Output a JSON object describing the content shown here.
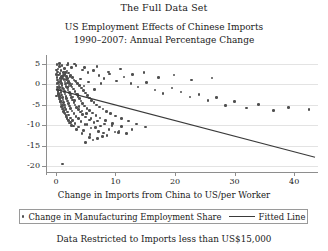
{
  "figure": {
    "caption_top": "The Full Data Set",
    "caption_bottom": "Data Restricted to Imports less than US$15,000"
  },
  "chart_data": {
    "type": "scatter",
    "title": "US Employment Effects of Chinese Imports",
    "subtitle": "1990–2007: Annual Percentage Change",
    "xlabel": "Change in Imports from China to US/per Worker",
    "ylabel": "",
    "xlim": [
      -1.5,
      44
    ],
    "ylim": [
      -21.5,
      6.5
    ],
    "xticks": [
      0,
      10,
      20,
      30,
      40
    ],
    "yticks": [
      5,
      0,
      -5,
      -10,
      -15,
      -20
    ],
    "xticklabels": [
      "0",
      "10",
      "20",
      "30",
      "40"
    ],
    "yticklabels": [
      "5",
      "0",
      "-5",
      "-10",
      "-15",
      "-20"
    ],
    "grid": "horizontal",
    "legend_position": "below-axes",
    "series": [
      {
        "name": "Change in Manufacturing Employment Share",
        "marker": "dot",
        "color": "#4f4f4f",
        "points": [
          [
            0.15,
            4.9
          ],
          [
            0.55,
            4.4
          ],
          [
            1.05,
            4.6
          ],
          [
            0.35,
            3.8
          ],
          [
            0.85,
            3.4
          ],
          [
            1.45,
            3.9
          ],
          [
            0.25,
            3.1
          ],
          [
            0.65,
            2.7
          ],
          [
            1.25,
            2.9
          ],
          [
            1.85,
            3.3
          ],
          [
            0.45,
            2.3
          ],
          [
            0.95,
            2.0
          ],
          [
            1.55,
            2.4
          ],
          [
            2.15,
            2.8
          ],
          [
            0.2,
            1.7
          ],
          [
            0.7,
            1.4
          ],
          [
            1.15,
            1.6
          ],
          [
            1.75,
            1.9
          ],
          [
            2.45,
            2.2
          ],
          [
            0.3,
            1.1
          ],
          [
            0.8,
            0.9
          ],
          [
            1.35,
            1.2
          ],
          [
            1.95,
            1.4
          ],
          [
            2.75,
            1.7
          ],
          [
            0.4,
            0.5
          ],
          [
            0.9,
            0.3
          ],
          [
            1.5,
            0.6
          ],
          [
            2.1,
            0.8
          ],
          [
            3.05,
            1.1
          ],
          [
            0.5,
            -0.1
          ],
          [
            1.0,
            -0.3
          ],
          [
            1.6,
            0.1
          ],
          [
            2.3,
            0.3
          ],
          [
            3.35,
            0.6
          ],
          [
            0.6,
            -0.7
          ],
          [
            1.1,
            -0.9
          ],
          [
            1.7,
            -0.5
          ],
          [
            2.5,
            -0.2
          ],
          [
            3.65,
            0.2
          ],
          [
            0.22,
            -1.2
          ],
          [
            0.75,
            -1.4
          ],
          [
            1.25,
            -1.1
          ],
          [
            1.9,
            -0.8
          ],
          [
            2.7,
            -0.6
          ],
          [
            4.0,
            -0.3
          ],
          [
            0.32,
            -1.8
          ],
          [
            0.88,
            -2.0
          ],
          [
            1.4,
            -1.7
          ],
          [
            2.05,
            -1.4
          ],
          [
            2.95,
            -1.1
          ],
          [
            4.3,
            -0.9
          ],
          [
            0.42,
            -2.4
          ],
          [
            0.98,
            -2.6
          ],
          [
            1.55,
            -2.3
          ],
          [
            2.25,
            -2.0
          ],
          [
            3.2,
            -1.7
          ],
          [
            4.6,
            -1.5
          ],
          [
            0.52,
            -3.0
          ],
          [
            1.08,
            -3.2
          ],
          [
            1.7,
            -2.9
          ],
          [
            2.4,
            -2.6
          ],
          [
            3.45,
            -2.3
          ],
          [
            4.95,
            -2.1
          ],
          [
            0.62,
            -3.6
          ],
          [
            1.18,
            -3.8
          ],
          [
            1.82,
            -3.5
          ],
          [
            2.6,
            -3.2
          ],
          [
            3.7,
            -2.9
          ],
          [
            5.3,
            -2.7
          ],
          [
            0.72,
            -4.2
          ],
          [
            1.3,
            -4.4
          ],
          [
            1.95,
            -4.1
          ],
          [
            2.8,
            -3.8
          ],
          [
            3.95,
            -3.5
          ],
          [
            5.65,
            -3.3
          ],
          [
            0.82,
            -4.8
          ],
          [
            1.42,
            -5.0
          ],
          [
            2.1,
            -4.7
          ],
          [
            3.0,
            -4.4
          ],
          [
            4.2,
            -4.1
          ],
          [
            6.0,
            -3.9
          ],
          [
            0.95,
            -5.4
          ],
          [
            1.55,
            -5.6
          ],
          [
            2.25,
            -5.3
          ],
          [
            3.2,
            -5.0
          ],
          [
            4.5,
            -4.7
          ],
          [
            6.4,
            -4.4
          ],
          [
            1.1,
            -6.0
          ],
          [
            1.7,
            -6.2
          ],
          [
            2.45,
            -5.9
          ],
          [
            3.45,
            -5.6
          ],
          [
            4.8,
            -5.3
          ],
          [
            6.8,
            -5.0
          ],
          [
            1.3,
            -6.6
          ],
          [
            1.9,
            -6.8
          ],
          [
            2.7,
            -6.5
          ],
          [
            3.75,
            -6.2
          ],
          [
            5.2,
            -5.9
          ],
          [
            7.3,
            -5.5
          ],
          [
            1.5,
            -7.3
          ],
          [
            2.15,
            -7.5
          ],
          [
            3.0,
            -7.1
          ],
          [
            4.1,
            -6.8
          ],
          [
            5.6,
            -6.4
          ],
          [
            7.9,
            -6.0
          ],
          [
            1.75,
            -8.0
          ],
          [
            2.45,
            -8.2
          ],
          [
            3.35,
            -7.8
          ],
          [
            4.5,
            -7.4
          ],
          [
            6.1,
            -7.0
          ],
          [
            8.5,
            -6.6
          ],
          [
            2.05,
            -8.7
          ],
          [
            2.8,
            -8.9
          ],
          [
            3.75,
            -8.4
          ],
          [
            5.0,
            -8.0
          ],
          [
            6.7,
            -7.6
          ],
          [
            9.2,
            -7.1
          ],
          [
            2.4,
            -9.4
          ],
          [
            3.2,
            -9.6
          ],
          [
            4.2,
            -9.1
          ],
          [
            5.6,
            -8.7
          ],
          [
            7.4,
            -8.2
          ],
          [
            10.0,
            -7.7
          ],
          [
            2.9,
            -10.2
          ],
          [
            3.8,
            -10.4
          ],
          [
            4.9,
            -9.9
          ],
          [
            6.4,
            -9.4
          ],
          [
            8.3,
            -8.9
          ],
          [
            11.0,
            -8.3
          ],
          [
            3.5,
            -11.0
          ],
          [
            4.6,
            -11.3
          ],
          [
            5.9,
            -10.7
          ],
          [
            7.5,
            -10.2
          ],
          [
            9.5,
            -9.6
          ],
          [
            12.2,
            -9.0
          ],
          [
            4.4,
            -12.0
          ],
          [
            5.7,
            -12.3
          ],
          [
            7.1,
            -11.6
          ],
          [
            8.9,
            -11.0
          ],
          [
            11.0,
            -10.3
          ],
          [
            13.5,
            -9.7
          ],
          [
            5.6,
            -13.0
          ],
          [
            7.0,
            -13.3
          ],
          [
            8.6,
            -12.5
          ],
          [
            10.5,
            -11.8
          ],
          [
            12.8,
            -11.1
          ],
          [
            15.0,
            -10.4
          ],
          [
            0.6,
            5.1
          ],
          [
            1.9,
            4.8
          ],
          [
            2.6,
            4.2
          ],
          [
            3.4,
            4.7
          ],
          [
            4.5,
            3.6
          ],
          [
            5.4,
            2.9
          ],
          [
            6.3,
            3.4
          ],
          [
            7.2,
            2.2
          ],
          [
            8.1,
            1.5
          ],
          [
            9.0,
            2.6
          ],
          [
            10.2,
            0.9
          ],
          [
            11.4,
            1.8
          ],
          [
            12.6,
            0.2
          ],
          [
            13.8,
            -0.6
          ],
          [
            15.2,
            0.5
          ],
          [
            16.6,
            -1.4
          ],
          [
            18.0,
            -2.2
          ],
          [
            19.5,
            -0.9
          ],
          [
            21.0,
            -1.9
          ],
          [
            22.5,
            -3.1
          ],
          [
            24.0,
            -2.4
          ],
          [
            25.5,
            -4.0
          ],
          [
            27.0,
            -3.2
          ],
          [
            28.5,
            -5.1
          ],
          [
            30.0,
            -4.2
          ],
          [
            32.0,
            -5.8
          ],
          [
            34.0,
            -4.9
          ],
          [
            36.5,
            -6.4
          ],
          [
            39.0,
            -5.6
          ],
          [
            42.5,
            -6.1
          ],
          [
            4.8,
            4.1
          ],
          [
            6.9,
            4.4
          ],
          [
            8.8,
            3.1
          ],
          [
            10.8,
            3.8
          ],
          [
            12.9,
            2.4
          ],
          [
            14.8,
            3.0
          ],
          [
            17.2,
            1.7
          ],
          [
            19.8,
            2.3
          ],
          [
            22.8,
            1.1
          ],
          [
            26.2,
            1.6
          ],
          [
            5.2,
            -9.8
          ],
          [
            6.6,
            -10.6
          ],
          [
            8.0,
            -11.9
          ],
          [
            9.4,
            -10.1
          ],
          [
            10.6,
            -11.4
          ],
          [
            9.9,
            -11.7
          ],
          [
            11.8,
            -12.1
          ],
          [
            7.8,
            -12.8
          ],
          [
            6.2,
            -13.6
          ],
          [
            5.0,
            -14.2
          ],
          [
            1.1,
            -19.5
          ],
          [
            0.18,
            0.2
          ],
          [
            0.28,
            -0.6
          ],
          [
            0.38,
            -1.5
          ],
          [
            0.48,
            -2.2
          ],
          [
            0.58,
            -2.9
          ],
          [
            0.68,
            -3.5
          ],
          [
            0.78,
            -4.2
          ],
          [
            0.88,
            0.8
          ],
          [
            0.98,
            1.5
          ],
          [
            1.08,
            -5.1
          ],
          [
            1.18,
            -5.8
          ],
          [
            1.28,
            2.2
          ],
          [
            1.38,
            -6.4
          ],
          [
            1.48,
            -7.0
          ],
          [
            1.58,
            2.9
          ],
          [
            1.68,
            -7.6
          ],
          [
            1.78,
            1.2
          ],
          [
            1.88,
            -8.3
          ],
          [
            1.98,
            0.4
          ],
          [
            2.08,
            -8.9
          ],
          [
            2.18,
            -0.4
          ],
          [
            2.28,
            -9.5
          ],
          [
            2.38,
            1.9
          ],
          [
            2.58,
            -10.1
          ],
          [
            2.68,
            0.1
          ],
          [
            2.88,
            -3.1
          ],
          [
            3.08,
            -4.0
          ],
          [
            3.28,
            0.9
          ],
          [
            3.58,
            -2.5
          ],
          [
            3.88,
            -5.4
          ],
          [
            4.1,
            1.3
          ],
          [
            4.35,
            -6.5
          ],
          [
            4.7,
            -0.4
          ],
          [
            5.1,
            -7.2
          ],
          [
            5.5,
            0.6
          ],
          [
            5.9,
            -8.4
          ],
          [
            6.5,
            -1.2
          ],
          [
            7.0,
            -9.0
          ],
          [
            7.6,
            0.3
          ],
          [
            8.2,
            -9.7
          ],
          [
            2.0,
            5.2
          ],
          [
            3.1,
            5.0
          ],
          [
            0.05,
            2.5
          ],
          [
            0.1,
            -2.8
          ],
          [
            0.12,
            3.6
          ]
        ]
      }
    ],
    "fit_line": {
      "name": "Fitted Line",
      "color": "#3a3a3a",
      "x_start": 0.0,
      "y_start": -1.2,
      "x_end": 43.5,
      "y_end": -17.9
    }
  },
  "legend": {
    "scatter_label": "Change in Manufacturing Employment Share",
    "line_label": "Fitted Line"
  }
}
